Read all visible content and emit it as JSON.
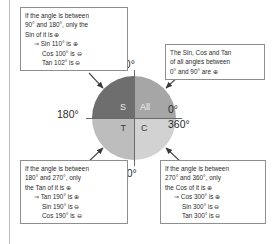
{
  "diagram": {
    "quadrants": [
      {
        "key": "sin",
        "label": "S",
        "position": "top-left",
        "fill": "#6e6e6e"
      },
      {
        "key": "all",
        "label": "All",
        "position": "top-right",
        "fill": "#a6a6a6"
      },
      {
        "key": "tan",
        "label": "T",
        "position": "bottom-left",
        "fill": "#bdbdbd"
      },
      {
        "key": "cos",
        "label": "C",
        "position": "bottom-right",
        "fill": "#d2d2d2"
      }
    ],
    "angle_labels": {
      "top": "90°",
      "left": "180°",
      "right_upper": "0°",
      "right_lower": "360°",
      "bottom": "270°"
    }
  },
  "callouts": {
    "top_left": {
      "lines": [
        "If the angle is between",
        "90° and 180°, only the",
        "Sin of it is ⊕"
      ],
      "examples": [
        "⇒ Sin 110° is ⊕",
        "Cos 100° is ⊖",
        "Tan 102° is ⊖"
      ]
    },
    "top_right": {
      "lines": [
        "The Sin, Cos and Tan",
        "of all angles between",
        "0° and 90° are ⊕"
      ],
      "examples": []
    },
    "bottom_left": {
      "lines": [
        "If the angle is between",
        "180° and 270°, only",
        "the Tan of it is ⊕"
      ],
      "examples": [
        "⇒ Tan 190° is ⊕",
        "Sin 190° is ⊖",
        "Cos 190° is ⊖"
      ]
    },
    "bottom_right": {
      "lines": [
        "If the angle is between",
        "270° and 360°, only",
        "the Cos of it is ⊕"
      ],
      "examples": [
        "⇒ Cos 300° is ⊕",
        "Sin 300° is ⊖",
        "Tan 300° is ⊖"
      ]
    }
  }
}
